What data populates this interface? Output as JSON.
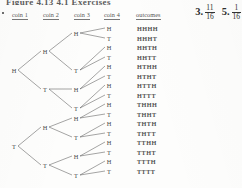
{
  "page": {
    "cut_running_header": "Figure 4.13   4.1 Exercises",
    "margin_bullet": "▪"
  },
  "answers": [
    {
      "number": "3.",
      "numerator": "11",
      "denominator": "16"
    },
    {
      "number": "5.",
      "numerator": "1",
      "denominator": "16"
    }
  ],
  "columns": [
    {
      "label": "coin 1",
      "x": 12
    },
    {
      "label": "coin 2",
      "x": 43
    },
    {
      "label": "coin 3",
      "x": 74
    },
    {
      "label": "coin 4",
      "x": 104
    },
    {
      "label": "outcomes",
      "x": 136
    }
  ],
  "tree": {
    "levels": [
      {
        "name": "coin-1",
        "x": 14,
        "nodes": [
          {
            "label": "H",
            "y": 70
          },
          {
            "label": "T",
            "y": 146
          }
        ]
      },
      {
        "name": "coin-2",
        "x": 45,
        "nodes": [
          {
            "label": "H",
            "y": 51
          },
          {
            "label": "T",
            "y": 89
          },
          {
            "label": "H",
            "y": 127
          },
          {
            "label": "T",
            "y": 165
          }
        ]
      },
      {
        "name": "coin-3",
        "x": 76,
        "nodes": [
          {
            "label": "H",
            "y": 33
          },
          {
            "label": "T",
            "y": 70
          },
          {
            "label": "H",
            "y": 89
          },
          {
            "label": "T",
            "y": 108
          },
          {
            "label": "H",
            "y": 118
          },
          {
            "label": "T",
            "y": 137
          },
          {
            "label": "H",
            "y": 156
          },
          {
            "label": "T",
            "y": 175
          }
        ]
      },
      {
        "name": "coin-4",
        "x": 109,
        "nodes": [
          {
            "label": "H",
            "y": 28
          },
          {
            "label": "T",
            "y": 38
          },
          {
            "label": "H",
            "y": 47
          },
          {
            "label": "T",
            "y": 57
          },
          {
            "label": "H",
            "y": 66
          },
          {
            "label": "T",
            "y": 76
          },
          {
            "label": "H",
            "y": 85
          },
          {
            "label": "T",
            "y": 95
          },
          {
            "label": "H",
            "y": 104
          },
          {
            "label": "T",
            "y": 114
          },
          {
            "label": "H",
            "y": 123
          },
          {
            "label": "T",
            "y": 133
          },
          {
            "label": "H",
            "y": 142
          },
          {
            "label": "T",
            "y": 152
          },
          {
            "label": "H",
            "y": 161
          },
          {
            "label": "T",
            "y": 171
          }
        ]
      }
    ]
  },
  "outcomes": [
    {
      "text": "HHHH",
      "y": 28
    },
    {
      "text": "HHHT",
      "y": 38
    },
    {
      "text": "HHTH",
      "y": 47
    },
    {
      "text": "HHTT",
      "y": 57
    },
    {
      "text": "HTHH",
      "y": 66
    },
    {
      "text": "HTHT",
      "y": 76
    },
    {
      "text": "HTTH",
      "y": 85
    },
    {
      "text": "HTTT",
      "y": 95
    },
    {
      "text": "THHH",
      "y": 104
    },
    {
      "text": "THHT",
      "y": 114
    },
    {
      "text": "THTH",
      "y": 123
    },
    {
      "text": "THTT",
      "y": 133
    },
    {
      "text": "TTHH",
      "y": 142
    },
    {
      "text": "TTHT",
      "y": 152
    },
    {
      "text": "TTTH",
      "y": 161
    },
    {
      "text": "TTTT",
      "y": 171
    }
  ],
  "colors": {
    "ink": "#4a4a4a",
    "background": "#fdfdfc",
    "rule": "#777777"
  }
}
